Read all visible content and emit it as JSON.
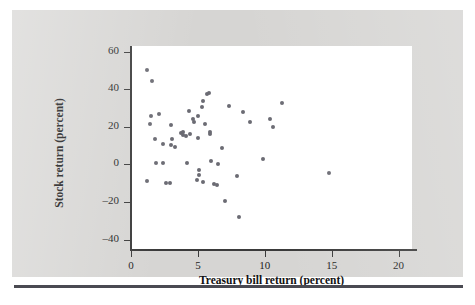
{
  "chart_data": {
    "type": "scatter",
    "title": "",
    "xlabel": "Treasury bill return (percent)",
    "ylabel": "Stock return (percent)",
    "xlim": [
      0,
      21
    ],
    "ylim": [
      -45,
      63
    ],
    "xticks": [
      0,
      5,
      10,
      15,
      20
    ],
    "xticklabels": [
      "0",
      "5",
      "10",
      "15",
      "20"
    ],
    "yticks": [
      60,
      40,
      20,
      0,
      -20,
      -40
    ],
    "yticklabels": [
      "60",
      "40",
      "20",
      "0",
      "–20",
      "–40"
    ],
    "grid": false,
    "legend": false,
    "marker_color": "#6b6b73",
    "plot_background": "#ffffff",
    "figure_background": "#d6d5d3",
    "points": [
      {
        "x": 1.2,
        "y": 50.0
      },
      {
        "x": 1.6,
        "y": 44.5
      },
      {
        "x": 1.5,
        "y": 25.5
      },
      {
        "x": 1.4,
        "y": 21.5
      },
      {
        "x": 2.1,
        "y": 27.0
      },
      {
        "x": 1.8,
        "y": 13.5
      },
      {
        "x": 1.2,
        "y": -9.0
      },
      {
        "x": 1.9,
        "y": 0.5
      },
      {
        "x": 2.4,
        "y": 11.0
      },
      {
        "x": 2.4,
        "y": 1.0
      },
      {
        "x": 2.6,
        "y": -10.0
      },
      {
        "x": 2.9,
        "y": -10.0
      },
      {
        "x": 3.0,
        "y": 21.0
      },
      {
        "x": 3.1,
        "y": 13.5
      },
      {
        "x": 3.0,
        "y": 10.5
      },
      {
        "x": 3.3,
        "y": 9.5
      },
      {
        "x": 3.7,
        "y": 16.5
      },
      {
        "x": 3.9,
        "y": 17.0
      },
      {
        "x": 3.9,
        "y": 15.5
      },
      {
        "x": 4.1,
        "y": 15.0
      },
      {
        "x": 4.3,
        "y": 28.5
      },
      {
        "x": 4.4,
        "y": 16.0
      },
      {
        "x": 4.2,
        "y": 0.5
      },
      {
        "x": 4.6,
        "y": 24.0
      },
      {
        "x": 4.7,
        "y": 22.5
      },
      {
        "x": 4.9,
        "y": -8.5
      },
      {
        "x": 5.0,
        "y": 25.5
      },
      {
        "x": 5.0,
        "y": 14.0
      },
      {
        "x": 5.1,
        "y": -3.0
      },
      {
        "x": 5.1,
        "y": -5.5
      },
      {
        "x": 5.3,
        "y": 30.5
      },
      {
        "x": 5.4,
        "y": 33.5
      },
      {
        "x": 5.5,
        "y": 21.5
      },
      {
        "x": 5.4,
        "y": -9.5
      },
      {
        "x": 5.7,
        "y": 37.5
      },
      {
        "x": 5.8,
        "y": 38.0
      },
      {
        "x": 5.9,
        "y": 17.0
      },
      {
        "x": 5.9,
        "y": 16.0
      },
      {
        "x": 6.0,
        "y": 2.0
      },
      {
        "x": 6.2,
        "y": -10.5
      },
      {
        "x": 6.4,
        "y": -11.0
      },
      {
        "x": 6.5,
        "y": 0.0
      },
      {
        "x": 6.8,
        "y": 8.5
      },
      {
        "x": 7.0,
        "y": -19.5
      },
      {
        "x": 7.3,
        "y": 31.0
      },
      {
        "x": 7.9,
        "y": -6.0
      },
      {
        "x": 8.1,
        "y": -28.0
      },
      {
        "x": 8.4,
        "y": 28.0
      },
      {
        "x": 8.9,
        "y": 22.5
      },
      {
        "x": 9.9,
        "y": 3.0
      },
      {
        "x": 10.4,
        "y": 24.0
      },
      {
        "x": 10.6,
        "y": 20.0
      },
      {
        "x": 11.3,
        "y": 32.5
      },
      {
        "x": 14.8,
        "y": -4.5
      }
    ]
  }
}
